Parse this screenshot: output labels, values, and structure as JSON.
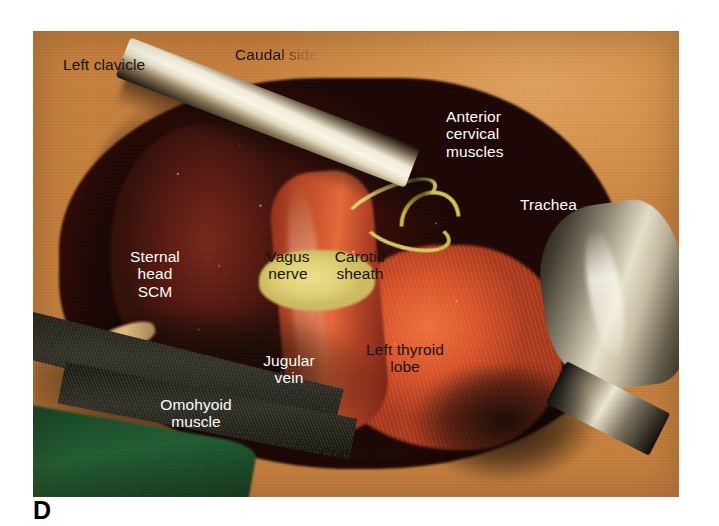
{
  "figure": {
    "panel_letter": "D",
    "photo_kind": "intraoperative-surgical-photograph",
    "region": "left anterior neck dissection"
  },
  "colors": {
    "skin": "#d9914b",
    "wound_deep": "#3d0c08",
    "muscle": "#6d2318",
    "thyroid": "#e06430",
    "vessel_loop_yellow": "#ddcd68",
    "vagus_highlight_yellow": "#e8da80",
    "green_drape": "#1d5a2e",
    "steel_instrument": "#e8e2cc",
    "label_dark": "#17120d",
    "label_light": "#fdfdfb",
    "panel_letter": "#000000"
  },
  "labels": [
    {
      "id": "left-clavicle",
      "text": "Left clavicle",
      "tone": "dark",
      "align": "left",
      "x": 63,
      "y": 56,
      "fade": false
    },
    {
      "id": "caudal-side",
      "text": "Caudal side",
      "tone": "dark",
      "align": "left",
      "x": 235,
      "y": 46,
      "fade": true
    },
    {
      "id": "anterior-cervical-muscles",
      "text": "Anterior\ncervical\nmuscles",
      "tone": "light",
      "align": "left",
      "x": 446,
      "y": 108,
      "fade": false
    },
    {
      "id": "trachea",
      "text": "Trachea",
      "tone": "light",
      "align": "left",
      "x": 520,
      "y": 196,
      "fade": false
    },
    {
      "id": "sternal-head-scm",
      "text": "Sternal\nhead\nSCM",
      "tone": "light",
      "align": "center",
      "x": 155,
      "y": 248,
      "fade": false
    },
    {
      "id": "vagus-nerve",
      "text": "Vagus\nnerve",
      "tone": "dark",
      "align": "center",
      "x": 288,
      "y": 248,
      "fade": false
    },
    {
      "id": "carotid-sheath",
      "text": "Carotid\nsheath",
      "tone": "dark",
      "align": "center",
      "x": 360,
      "y": 248,
      "fade": false
    },
    {
      "id": "jugular-vein",
      "text": "Jugular\nvein",
      "tone": "light",
      "align": "center",
      "x": 289,
      "y": 352,
      "fade": false
    },
    {
      "id": "left-thyroid-lobe",
      "text": "Left thyroid\nlobe",
      "tone": "dark",
      "align": "center",
      "x": 405,
      "y": 341,
      "fade": false
    },
    {
      "id": "omohyoid-muscle",
      "text": "Omohyoid\nmuscle",
      "tone": "light",
      "align": "center",
      "x": 196,
      "y": 396,
      "fade": false
    },
    {
      "id": "cranial-side",
      "text": "Cranial side",
      "tone": "dark",
      "align": "left",
      "x": 320,
      "y": 444,
      "fade": false
    }
  ]
}
